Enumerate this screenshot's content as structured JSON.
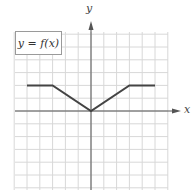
{
  "chart_data": {
    "type": "line",
    "title": "",
    "legend_label": "y = f(x)",
    "xlabel": "x",
    "ylabel": "y",
    "grid": true,
    "xlim": [
      -6,
      6
    ],
    "ylim": [
      -6,
      6
    ],
    "x": [
      -5,
      -3,
      0,
      3,
      5
    ],
    "y": [
      2,
      2,
      0,
      2,
      2
    ],
    "tick_labels": "none shown",
    "colors": {
      "line": "#444444",
      "grid": "#d8d8d8",
      "axis": "#555555"
    }
  },
  "labels": {
    "function_label": "y = f(x)",
    "x_axis": "x",
    "y_axis": "y"
  }
}
